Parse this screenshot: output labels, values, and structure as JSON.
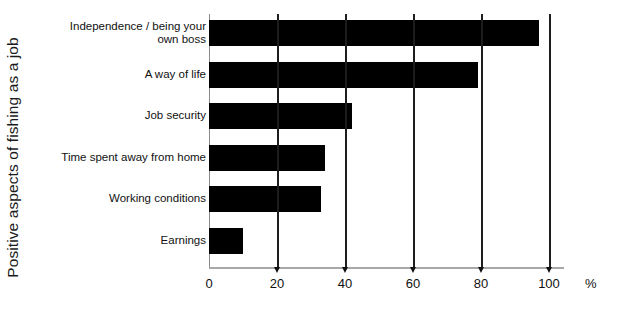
{
  "chart_data": {
    "type": "bar",
    "orientation": "horizontal",
    "title": "",
    "xlabel": "%",
    "ylabel": "Positive aspects of fishing as a job",
    "categories": [
      "Independence / being your\nown boss",
      "A way of life",
      "Job security",
      "Time spent away from home",
      "Working conditions",
      "Earnings"
    ],
    "values": [
      97,
      79,
      42,
      34,
      33,
      10
    ],
    "xlim": [
      0,
      100
    ],
    "xticks": [
      0,
      20,
      40,
      60,
      80,
      100
    ],
    "xtick_labels": [
      "0",
      "20",
      "40",
      "60",
      "80",
      "100"
    ],
    "grid": "vertical",
    "legend": "none",
    "bar_color": "#000000",
    "background_color": "#ffffff"
  }
}
